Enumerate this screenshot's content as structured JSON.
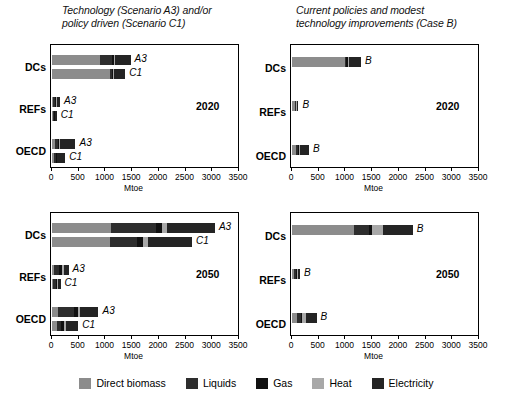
{
  "figure": {
    "axis_title": "Mtoe",
    "xlim": [
      0,
      3500
    ],
    "xticks": [
      0,
      500,
      1000,
      1500,
      2000,
      2500,
      3000,
      3500
    ],
    "xticklabels": [
      "0",
      "500",
      "1000",
      "1500",
      "2000",
      "2500",
      "3000",
      "3500"
    ],
    "regions": [
      "DCs",
      "REFs",
      "OECD"
    ]
  },
  "colors": {
    "direct_biomass": "#8c8c8c",
    "liquids": "#2e2e2e",
    "gas": "#111111",
    "heat": "#a8a8a8",
    "electricity": "#242424",
    "axis": "#000000",
    "background": "#ffffff"
  },
  "legend": {
    "items": [
      {
        "label": "Direct biomass",
        "color_key": "direct_biomass"
      },
      {
        "label": "Liquids",
        "color_key": "liquids"
      },
      {
        "label": "Gas",
        "color_key": "gas"
      },
      {
        "label": "Heat",
        "color_key": "heat"
      },
      {
        "label": "Electricity",
        "color_key": "electricity"
      }
    ]
  },
  "panels": [
    {
      "id": "top-left",
      "title": "Technology (Scenario A3) and/or\npolicy driven (Scenario C1)",
      "year": "2020",
      "axis_title": "Mtoe"
    },
    {
      "id": "top-right",
      "title": "Current policies and modest\ntechnology improvements (Case B)",
      "year": "2020",
      "axis_title": "Mtoe"
    },
    {
      "id": "bottom-left",
      "title": "",
      "year": "2050",
      "axis_title": "Mtoe"
    },
    {
      "id": "bottom-right",
      "title": "",
      "year": "2050",
      "axis_title": "Mtoe"
    }
  ],
  "chart_data": {
    "type": "bar",
    "orientation": "horizontal",
    "stacked": true,
    "xlabel": "Mtoe",
    "ylabel": "",
    "xlim": [
      0,
      3500
    ],
    "grid": false,
    "legend_position": "bottom",
    "series": [
      {
        "name": "Direct biomass",
        "color": "#8c8c8c"
      },
      {
        "name": "Liquids",
        "color": "#2e2e2e"
      },
      {
        "name": "Gas",
        "color": "#111111"
      },
      {
        "name": "Heat",
        "color": "#a8a8a8"
      },
      {
        "name": "Electricity",
        "color": "#242424"
      }
    ],
    "panels": [
      {
        "panel": "Technology (Scenario A3) and/or policy driven (Scenario C1)",
        "year": 2020,
        "bars": [
          {
            "region": "DCs",
            "scenario": "A3",
            "values": {
              "Direct biomass": 900,
              "Liquids": 220,
              "Gas": 40,
              "Heat": 20,
              "Electricity": 290
            },
            "total": 1470
          },
          {
            "region": "DCs",
            "scenario": "C1",
            "values": {
              "Direct biomass": 1090,
              "Liquids": 30,
              "Gas": 30,
              "Heat": 20,
              "Electricity": 200
            },
            "total": 1370
          },
          {
            "region": "REFs",
            "scenario": "A3",
            "values": {
              "Direct biomass": 20,
              "Liquids": 40,
              "Gas": 20,
              "Heat": 20,
              "Electricity": 50
            },
            "total": 150
          },
          {
            "region": "REFs",
            "scenario": "C1",
            "values": {
              "Direct biomass": 10,
              "Liquids": 30,
              "Gas": 10,
              "Heat": 10,
              "Electricity": 30
            },
            "total": 90
          },
          {
            "region": "OECD",
            "scenario": "A3",
            "values": {
              "Direct biomass": 60,
              "Liquids": 50,
              "Gas": 30,
              "Heat": 10,
              "Electricity": 290
            },
            "total": 440
          },
          {
            "region": "OECD",
            "scenario": "C1",
            "values": {
              "Direct biomass": 40,
              "Liquids": 30,
              "Gas": 20,
              "Heat": 10,
              "Electricity": 150
            },
            "total": 250
          }
        ]
      },
      {
        "panel": "Current policies and modest technology improvements (Case B)",
        "year": 2020,
        "bars": [
          {
            "region": "DCs",
            "scenario": "B",
            "values": {
              "Direct biomass": 990,
              "Liquids": 30,
              "Gas": 20,
              "Heat": 20,
              "Electricity": 230
            },
            "total": 1290
          },
          {
            "region": "REFs",
            "scenario": "B",
            "values": {
              "Direct biomass": 50,
              "Liquids": 20,
              "Gas": 10,
              "Heat": 10,
              "Electricity": 30
            },
            "total": 120
          },
          {
            "region": "OECD",
            "scenario": "B",
            "values": {
              "Direct biomass": 70,
              "Liquids": 40,
              "Gas": 20,
              "Heat": 20,
              "Electricity": 170
            },
            "total": 320
          }
        ]
      },
      {
        "panel": "Technology (Scenario A3) and/or policy driven (Scenario C1)",
        "year": 2050,
        "bars": [
          {
            "region": "DCs",
            "scenario": "A3",
            "values": {
              "Direct biomass": 1100,
              "Liquids": 850,
              "Gas": 110,
              "Heat": 90,
              "Electricity": 900
            },
            "total": 3050
          },
          {
            "region": "DCs",
            "scenario": "C1",
            "values": {
              "Direct biomass": 1080,
              "Liquids": 520,
              "Gas": 110,
              "Heat": 80,
              "Electricity": 830
            },
            "total": 2620
          },
          {
            "region": "REFs",
            "scenario": "A3",
            "values": {
              "Direct biomass": 40,
              "Liquids": 100,
              "Gas": 50,
              "Heat": 30,
              "Electricity": 90
            },
            "total": 310
          },
          {
            "region": "REFs",
            "scenario": "C1",
            "values": {
              "Direct biomass": 20,
              "Liquids": 50,
              "Gas": 30,
              "Heat": 20,
              "Electricity": 40
            },
            "total": 160
          },
          {
            "region": "OECD",
            "scenario": "A3",
            "values": {
              "Direct biomass": 120,
              "Liquids": 290,
              "Gas": 70,
              "Heat": 50,
              "Electricity": 340
            },
            "total": 870
          },
          {
            "region": "OECD",
            "scenario": "C1",
            "values": {
              "Direct biomass": 90,
              "Liquids": 70,
              "Gas": 60,
              "Heat": 40,
              "Electricity": 230
            },
            "total": 490
          }
        ]
      },
      {
        "panel": "Current policies and modest technology improvements (Case B)",
        "year": 2050,
        "bars": [
          {
            "region": "DCs",
            "scenario": "B",
            "values": {
              "Direct biomass": 1160,
              "Liquids": 290,
              "Gas": 40,
              "Heat": 210,
              "Electricity": 560
            },
            "total": 2260
          },
          {
            "region": "REFs",
            "scenario": "B",
            "values": {
              "Direct biomass": 40,
              "Liquids": 30,
              "Gas": 20,
              "Heat": 20,
              "Electricity": 40
            },
            "total": 150
          },
          {
            "region": "OECD",
            "scenario": "B",
            "values": {
              "Direct biomass": 90,
              "Liquids": 70,
              "Gas": 30,
              "Heat": 70,
              "Electricity": 200
            },
            "total": 460
          }
        ]
      }
    ]
  }
}
